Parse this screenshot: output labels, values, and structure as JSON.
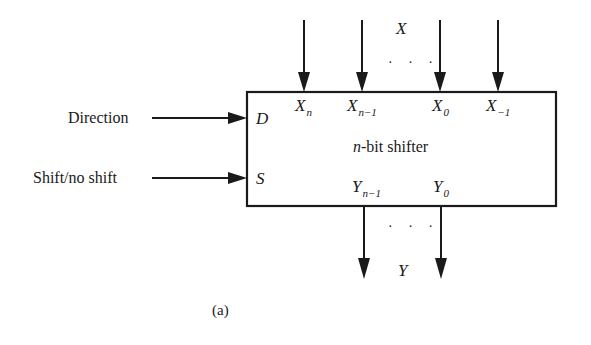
{
  "diagram": {
    "type": "block-diagram",
    "block": {
      "title_var": "n",
      "title_rest": "-bit shifter"
    },
    "inputs_top": {
      "group_label": "X",
      "ellipsis": "· · ·",
      "lines": [
        {
          "name": "X",
          "sub": "n"
        },
        {
          "name": "X",
          "sub": "n−1"
        },
        {
          "name": "X",
          "sub": "0"
        },
        {
          "name": "X",
          "sub": "−1"
        }
      ]
    },
    "control_inputs": [
      {
        "label": "Direction",
        "port": "D"
      },
      {
        "label": "Shift/no shift",
        "port": "S"
      }
    ],
    "outputs_bottom": {
      "group_label": "Y",
      "ellipsis": "· · ·",
      "lines": [
        {
          "name": "Y",
          "sub": "n−1"
        },
        {
          "name": "Y",
          "sub": "0"
        }
      ]
    },
    "caption": "(a)"
  },
  "colors": {
    "stroke": "#1a1a1a",
    "background": "#ffffff"
  }
}
